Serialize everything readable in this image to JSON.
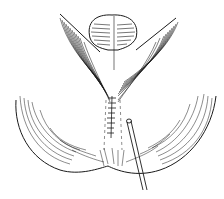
{
  "illustration": {
    "subject": "surgical line drawing: sutured incision with drain tube",
    "colors": {
      "ink": "#1a1a1a",
      "background": "#ffffff"
    },
    "elements": [
      "upper-mound",
      "left-wing",
      "right-wing",
      "lower-lobe",
      "suture-line",
      "drain-tube"
    ]
  }
}
